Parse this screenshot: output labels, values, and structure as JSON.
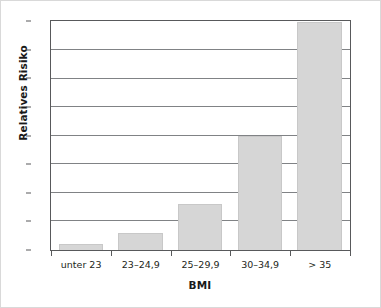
{
  "chart_data": {
    "type": "bar",
    "title": "",
    "subtitle": "",
    "xlabel": "BMI",
    "ylabel": "Relatives Risiko",
    "categories": [
      "unter 23",
      "23–24,9",
      "25–29,9",
      "30–34,9",
      "> 35"
    ],
    "values": [
      1,
      3,
      8,
      20,
      40
    ],
    "series": [
      {
        "name": "Relatives Risiko",
        "values": [
          1,
          3,
          8,
          20,
          40
        ]
      }
    ],
    "ylim": [
      0,
      40
    ],
    "yticks": [
      0,
      5,
      10,
      15,
      20,
      25,
      30,
      35,
      40
    ],
    "ytick_labels": [
      "0",
      "5",
      "10",
      "15",
      "20",
      "25",
      "30",
      "35",
      "40"
    ],
    "grid": true,
    "grid_axis": "y",
    "legend": false,
    "legend_position": "none",
    "annotations": [],
    "colors": {
      "bar_fill": "#d6d6d6",
      "bar_edge": "#c8c8c8",
      "gridline": "#808285",
      "frame": "#58595b",
      "text": "#231f20",
      "outer_border": "#d9d9d9",
      "background": "#ffffff"
    }
  }
}
